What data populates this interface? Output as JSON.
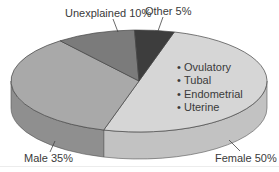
{
  "chart_data": {
    "type": "pie",
    "style": "3d",
    "title": "",
    "slices": [
      {
        "label": "Female",
        "value": 50,
        "display": "Female 50%",
        "color": "#d6d6d6",
        "side_color": "#c2c2c2"
      },
      {
        "label": "Male",
        "value": 35,
        "display": "Male 35%",
        "color": "#a9a9a9",
        "side_color": "#8f8f8f"
      },
      {
        "label": "Unexplained",
        "value": 10,
        "display": "Unexplained 10%",
        "color": "#7b7b7b",
        "side_color": "#666666"
      },
      {
        "label": "Other",
        "value": 5,
        "display": "Other 5%",
        "color": "#3d3d3d",
        "side_color": "#2e2e2e"
      }
    ],
    "annotations": {
      "female_causes": [
        "Ovulatory",
        "Tubal",
        "Endometrial",
        "Uterine"
      ]
    },
    "legend": "none (inline slice labels)"
  },
  "labels": {
    "unexplained": "Unexplained 10%",
    "other": "Other 5%",
    "male": "Male 35%",
    "female": "Female 50%"
  },
  "bullets": {
    "marker": "•",
    "items": [
      "Ovulatory",
      "Tubal",
      "Endometrial",
      "Uterine"
    ]
  }
}
